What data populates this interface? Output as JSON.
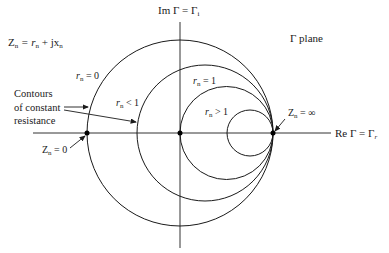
{
  "diagram": {
    "title_equation": {
      "main": "Z",
      "sub": "n",
      "rest": " = r",
      "sub2": "n",
      "rest2": " + jx",
      "sub3": "n"
    },
    "plane_label": "Γ plane",
    "axes": {
      "imag": {
        "main": "Im Γ = Γ",
        "sub": "i"
      },
      "real": {
        "main": "Re Γ = Γ",
        "sub": "r"
      }
    },
    "circle_labels": {
      "r0": {
        "main": "r",
        "sub": "n",
        "rest": " = 0"
      },
      "rlt1": {
        "main": "r",
        "sub": "n",
        "rest": " < 1"
      },
      "r1": {
        "main": "r",
        "sub": "n",
        "rest": " = 1"
      },
      "rgt1": {
        "main": "r",
        "sub": "n",
        "rest": " > 1"
      }
    },
    "points": {
      "zero": {
        "main": "Z",
        "sub": "n",
        "rest": " = 0"
      },
      "inf": {
        "main": "Z",
        "sub": "n",
        "rest": " = ∞"
      }
    },
    "annotation": [
      "Contours",
      "of constant",
      "resistance"
    ],
    "colors": {
      "line": "#1a1a1a",
      "background": "#ffffff"
    }
  }
}
